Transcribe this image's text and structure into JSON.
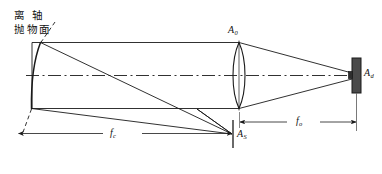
{
  "figure": {
    "title_note": "off-axis parabolic mirror collimator with objective lens and detector",
    "background_color": "#ffffff",
    "line_color": "#1a1a1a",
    "detector_fill": "#4a4a4a",
    "axis_style": "dash-dot"
  },
  "labels": {
    "mirror_line1": "离 轴",
    "mirror_line2": "抛物面",
    "lens_aperture": "A",
    "lens_aperture_sub": "0",
    "detector": "A",
    "detector_sub": "d",
    "source_stop": "A",
    "source_stop_sub": "S",
    "focal_collimator": "f",
    "focal_collimator_sub": "c",
    "focal_objective": "f",
    "focal_objective_sub": "o"
  },
  "elements": {
    "mirror": "off-axis-paraboloid-mirror",
    "lens": "biconvex-objective-lens",
    "detector": "detector-element",
    "stop": "source-aperture-stop",
    "optical_axis": "optical-axis",
    "beam_envelope": "collimated-beam-envelope",
    "dim_fc": "dimension-line-fc",
    "dim_fo": "dimension-line-fo"
  }
}
